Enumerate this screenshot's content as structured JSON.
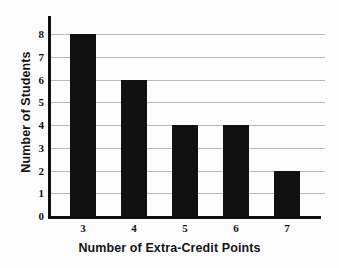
{
  "chart_data": {
    "type": "bar",
    "title": "",
    "subtitle": "",
    "categories": [
      "3",
      "4",
      "5",
      "6",
      "7"
    ],
    "values": [
      8,
      6,
      4,
      4,
      2
    ],
    "xlabel": "Number of Extra-Credit Points",
    "ylabel": "Number of Students",
    "xlim": [
      2.5,
      7.5
    ],
    "ylim": [
      0,
      8
    ],
    "y_ticks": [
      0,
      1,
      2,
      3,
      4,
      5,
      6,
      7,
      8
    ],
    "y_tick_labels": [
      "0",
      "1",
      "2",
      "3",
      "4",
      "5",
      "6",
      "7",
      "8"
    ],
    "x_tick_labels": [
      "3",
      "4",
      "5",
      "6",
      "7"
    ],
    "grid": true,
    "grid_axis": "y",
    "legend": false,
    "legend_position": "none",
    "bar_color": "#111111",
    "grid_color": "#b9b9b9",
    "axis_color": "#101010",
    "background_color": "#fdfdfd",
    "annotations": []
  }
}
